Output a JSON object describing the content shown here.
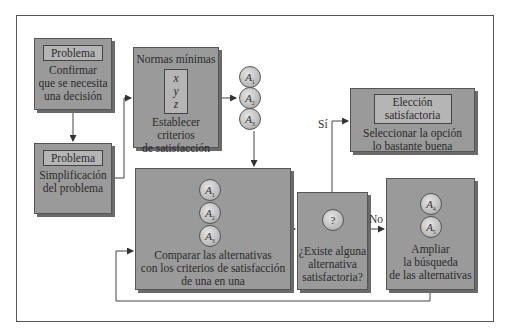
{
  "diagram": {
    "box_problem_confirm": {
      "header": "Problema",
      "lines": [
        "Confirmar",
        "que se necesita",
        "una decisión"
      ]
    },
    "box_problem_simplify": {
      "header": "Problema",
      "lines": [
        "Simplificación",
        "del problema"
      ]
    },
    "box_min_norms": {
      "title": "Normas mínimas",
      "vars": [
        "x",
        "y",
        "z"
      ],
      "lines": [
        "Establecer",
        "criterios",
        "de satisfacción"
      ]
    },
    "alternatives_initial": [
      {
        "label": "A",
        "sub": "1"
      },
      {
        "label": "A",
        "sub": "2"
      },
      {
        "label": "A",
        "sub": "3"
      }
    ],
    "box_compare": {
      "alternatives": [
        {
          "label": "A",
          "sub": "1"
        },
        {
          "label": "A",
          "sub": "2"
        },
        {
          "label": "A",
          "sub": "3"
        }
      ],
      "lines": [
        "Comparar las alternativas",
        "con los criterios de satisfacción",
        "de una en una"
      ]
    },
    "box_question": {
      "symbol": "?",
      "lines": [
        "¿Existe alguna",
        "alternativa",
        "satisfactoria?"
      ]
    },
    "box_choice": {
      "header_lines": [
        "Elección",
        "satisfactoria"
      ],
      "lines": [
        "Seleccionar la opción",
        "lo bastante buena"
      ]
    },
    "box_expand": {
      "alternatives": [
        {
          "label": "A",
          "sub": "4"
        },
        {
          "label": "A",
          "sub": "5"
        }
      ],
      "lines": [
        "Ampliar",
        "la búsqueda",
        "de las alternativas"
      ]
    },
    "edge_labels": {
      "yes": "Sí",
      "no": "No"
    }
  }
}
